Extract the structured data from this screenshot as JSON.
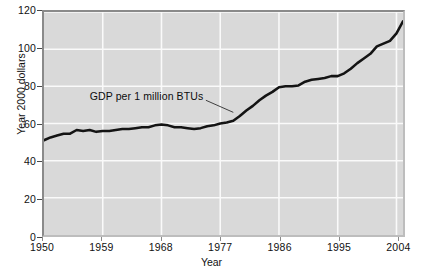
{
  "chart_data": {
    "type": "line",
    "title": "",
    "subtitle": "",
    "xlabel": "Year",
    "ylabel": "Year 2000 dollars",
    "xlim": [
      1950,
      2005
    ],
    "ylim": [
      0,
      120
    ],
    "grid": true,
    "legend": "none",
    "annotations": [
      {
        "text": "GDP per 1 million BTUs",
        "x": 1963,
        "y": 74,
        "leader_to_x": 1979,
        "leader_to_y": 66
      }
    ],
    "x_tick_labels": [
      "1950",
      "1959",
      "1968",
      "1977",
      "1986",
      "1995",
      "2004"
    ],
    "x_ticks": [
      1950,
      1959,
      1968,
      1977,
      1986,
      1995,
      2004
    ],
    "y_tick_labels": [
      "0",
      "20",
      "40",
      "60",
      "80",
      "100",
      "120"
    ],
    "y_ticks": [
      0,
      20,
      40,
      60,
      80,
      100,
      120
    ],
    "series": [
      {
        "name": "GDP per 1 million BTUs",
        "color": "#141414",
        "x": [
          1950,
          1951,
          1952,
          1953,
          1954,
          1955,
          1956,
          1957,
          1958,
          1959,
          1960,
          1961,
          1962,
          1963,
          1964,
          1965,
          1966,
          1967,
          1968,
          1969,
          1970,
          1971,
          1972,
          1973,
          1974,
          1975,
          1976,
          1977,
          1978,
          1979,
          1980,
          1981,
          1982,
          1983,
          1984,
          1985,
          1986,
          1987,
          1988,
          1989,
          1990,
          1991,
          1992,
          1993,
          1994,
          1995,
          1996,
          1997,
          1998,
          1999,
          2000,
          2001,
          2002,
          2003,
          2004,
          2005
        ],
        "values": [
          51.0,
          52.5,
          53.5,
          54.5,
          54.5,
          56.5,
          56.0,
          56.5,
          55.5,
          56.0,
          56.0,
          56.5,
          57.0,
          57.0,
          57.5,
          58.0,
          58.0,
          59.0,
          59.5,
          59.0,
          58.0,
          58.0,
          57.5,
          57.0,
          57.5,
          58.5,
          59.0,
          60.0,
          60.5,
          61.5,
          64.0,
          67.0,
          69.5,
          72.5,
          75.0,
          77.0,
          79.5,
          80.0,
          80.0,
          80.5,
          82.5,
          83.5,
          84.0,
          84.5,
          85.5,
          85.5,
          87.0,
          89.5,
          92.5,
          95.0,
          97.5,
          101.5,
          103.0,
          104.5,
          108.5,
          115.0
        ]
      }
    ]
  },
  "axes": {
    "y_title": "Year 2000 dollars",
    "x_title": "Year"
  }
}
